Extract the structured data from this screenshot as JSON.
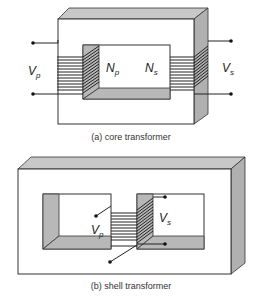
{
  "figure": {
    "core": {
      "caption": "(a) core transformer",
      "labels": {
        "vp": "V",
        "vp_sub": "p",
        "np": "N",
        "np_sub": "p",
        "ns": "N",
        "ns_sub": "s",
        "vs": "V",
        "vs_sub": "s"
      }
    },
    "shell": {
      "caption": "(b) shell transformer",
      "labels": {
        "vp": "V",
        "vp_sub": "p",
        "vs": "V",
        "vs_sub": "s"
      }
    },
    "colors": {
      "outline": "#333333",
      "shade": "#b8b8b8",
      "background": "#ffffff"
    }
  }
}
